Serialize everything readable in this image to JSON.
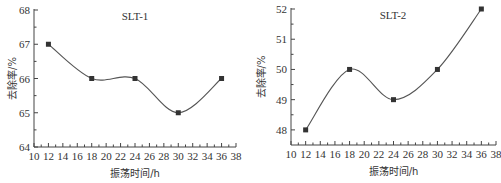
{
  "chart_data": [
    {
      "type": "line",
      "title": "SLT-1",
      "xlabel": "振荡时间/h",
      "ylabel": "去除率/%",
      "x": [
        12,
        18,
        24,
        30,
        36
      ],
      "series": [
        {
          "name": "SLT-1",
          "values": [
            67,
            66,
            66,
            65,
            66
          ]
        }
      ],
      "xlim": [
        10,
        38
      ],
      "ylim": [
        64,
        68
      ],
      "xticks": [
        10,
        12,
        14,
        16,
        18,
        20,
        22,
        24,
        26,
        28,
        30,
        32,
        34,
        36,
        38
      ],
      "yticks": [
        64,
        65,
        66,
        67,
        68
      ],
      "grid": false,
      "legend": false,
      "smooth": true,
      "marker": "square"
    },
    {
      "type": "line",
      "title": "SLT-2",
      "xlabel": "振荡时间/h",
      "ylabel": "去除率/%",
      "x": [
        12,
        18,
        24,
        30,
        36
      ],
      "series": [
        {
          "name": "SLT-2",
          "values": [
            48,
            50,
            49,
            50,
            52
          ]
        }
      ],
      "xlim": [
        10,
        38
      ],
      "ylim": [
        47.5,
        52
      ],
      "xticks": [
        10,
        12,
        14,
        16,
        18,
        20,
        22,
        24,
        26,
        28,
        30,
        32,
        34,
        36,
        38
      ],
      "yticks": [
        48,
        49,
        50,
        51,
        52
      ],
      "grid": false,
      "legend": false,
      "smooth": true,
      "marker": "square"
    }
  ],
  "colors": {
    "line": "#555555",
    "marker": "#333333",
    "axis": "#444444",
    "text": "#333333"
  }
}
